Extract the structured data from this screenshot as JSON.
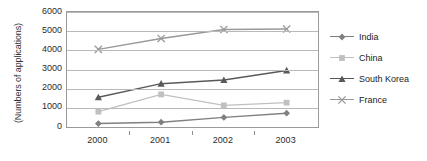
{
  "chart_data": {
    "type": "line",
    "title": "",
    "xlabel": "",
    "ylabel": "(Numbers of applications)",
    "categories": [
      "2000",
      "2001",
      "2002",
      "2003"
    ],
    "x": [
      2000,
      2001,
      2002,
      2003
    ],
    "ylim": [
      0,
      6000
    ],
    "ytick_labels": [
      "0",
      "1000",
      "2000",
      "3000",
      "4000",
      "5000",
      "6000"
    ],
    "ytick_values": [
      0,
      1000,
      2000,
      3000,
      4000,
      5000,
      6000
    ],
    "grid": true,
    "legend_position": "right",
    "series": [
      {
        "name": "India",
        "marker": "diamond",
        "color": "#808080",
        "values": [
          180,
          250,
          500,
          720
        ]
      },
      {
        "name": "China",
        "marker": "square",
        "color": "#c0c0c0",
        "values": [
          800,
          1700,
          1130,
          1270
        ]
      },
      {
        "name": "South Korea",
        "marker": "triangle",
        "color": "#595959",
        "values": [
          1550,
          2260,
          2450,
          2950
        ]
      },
      {
        "name": "France",
        "marker": "cross-x",
        "color": "#999999",
        "values": [
          4050,
          4620,
          5090,
          5110
        ]
      }
    ]
  },
  "axis": {
    "y_title": "(Numbers of applications)"
  },
  "legend": {
    "items": [
      {
        "label": "India"
      },
      {
        "label": "China"
      },
      {
        "label": "South Korea"
      },
      {
        "label": "France"
      }
    ]
  }
}
